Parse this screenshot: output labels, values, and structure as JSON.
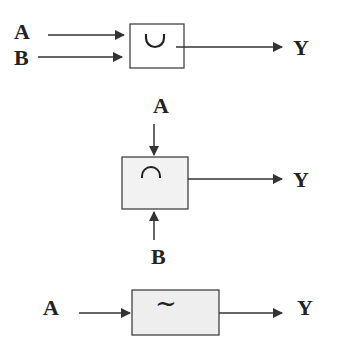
{
  "diagram": {
    "union": {
      "inputs": [
        "A",
        "B"
      ],
      "output": "Y",
      "symbol": "∪",
      "symbol_name": "union-icon",
      "fill": "#ffffff"
    },
    "intersection": {
      "inputs": [
        "A",
        "B"
      ],
      "output": "Y",
      "symbol": "∩",
      "symbol_name": "intersection-icon",
      "fill": "#f2f2f2"
    },
    "complement": {
      "inputs": [
        "A"
      ],
      "output": "Y",
      "symbol": "~",
      "symbol_name": "complement-icon",
      "fill": "#eeeeee"
    },
    "stroke": "#333333"
  }
}
